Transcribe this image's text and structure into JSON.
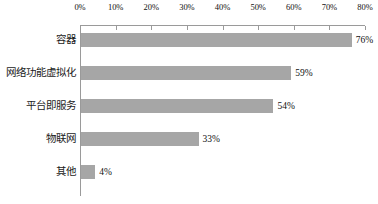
{
  "chart_data": {
    "type": "bar",
    "orientation": "horizontal",
    "title": "",
    "subtitle": "",
    "xlabel": "",
    "ylabel": "",
    "xlim": [
      0,
      80
    ],
    "grid": false,
    "legend": false,
    "bar_color": "#a6a6a6",
    "axis_color": "#9a9a9a",
    "categories": [
      "容器",
      "网络功能虚拟化",
      "平台即服务",
      "物联网",
      "其他"
    ],
    "values": [
      76,
      59,
      54,
      33,
      4
    ],
    "value_labels": [
      "76%",
      "59%",
      "54%",
      "33%",
      "4%"
    ],
    "x_ticks": [
      0,
      10,
      20,
      30,
      40,
      50,
      60,
      70,
      80
    ],
    "x_tick_labels": [
      "0%",
      "10%",
      "20%",
      "30%",
      "40%",
      "50%",
      "60%",
      "70%",
      "80%"
    ]
  }
}
